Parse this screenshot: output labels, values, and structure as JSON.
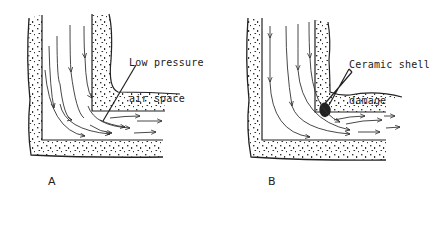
{
  "diagrams": [
    {
      "id": "A",
      "panel_label": "A",
      "annotation_line1": "Low pressure",
      "annotation_line2": "air space"
    },
    {
      "id": "B",
      "panel_label": "B",
      "annotation_line1": "Ceramic shell",
      "annotation_line2": "damage"
    }
  ],
  "colors": {
    "ink": "#222222",
    "background": "#ffffff"
  }
}
